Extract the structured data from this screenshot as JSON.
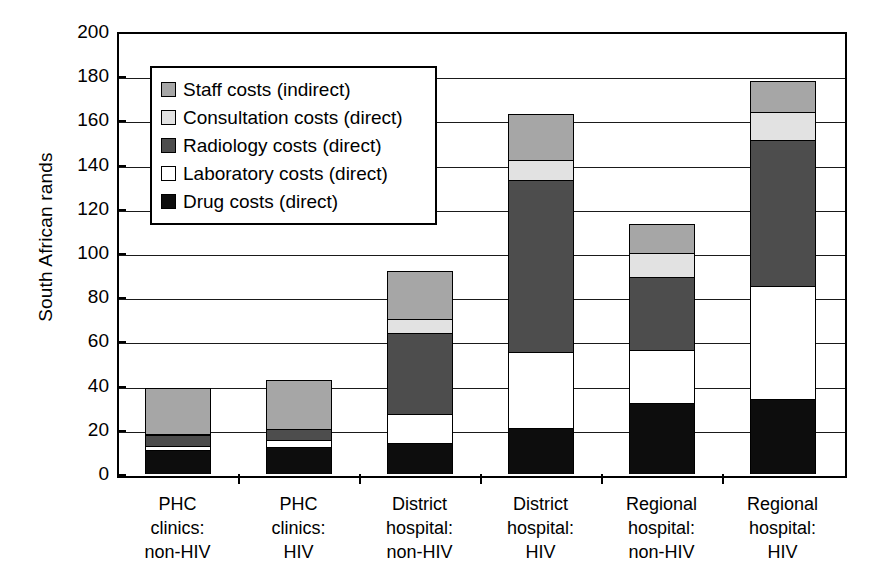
{
  "chart_data": {
    "type": "bar",
    "subtype": "stacked",
    "title": "",
    "xlabel": "",
    "ylabel": "South African rands",
    "ylim": [
      0,
      200
    ],
    "ytick_step": 20,
    "yticks": [
      200,
      180,
      160,
      140,
      120,
      100,
      80,
      60,
      40,
      20,
      0
    ],
    "grid": true,
    "legend_position": "upper-left-inside",
    "categories": [
      "PHC\nclinics:\nnon-HIV",
      "PHC\nclinics:\nHIV",
      "District\nhospital:\nnon-HIV",
      "District\nhospital:\nHIV",
      "Regional\nhospital:\nnon-HIV",
      "Regional\nhospital:\nHIV"
    ],
    "category_lines": [
      [
        "PHC",
        "clinics:",
        "non-HIV"
      ],
      [
        "PHC",
        "clinics:",
        "HIV"
      ],
      [
        "District",
        "hospital:",
        "non-HIV"
      ],
      [
        "District",
        "hospital:",
        "HIV"
      ],
      [
        "Regional",
        "hospital:",
        "non-HIV"
      ],
      [
        "Regional",
        "hospital:",
        "HIV"
      ]
    ],
    "series": [
      {
        "name": "Drug costs (direct)",
        "color": "#0d0d0d",
        "values": [
          11,
          12,
          14,
          21,
          32,
          34
        ]
      },
      {
        "name": "Laboratory costs (direct)",
        "color": "#ffffff",
        "values": [
          1.5,
          3.5,
          13,
          34,
          24,
          51
        ]
      },
      {
        "name": "Radiology costs (direct)",
        "color": "#4d4d4d",
        "values": [
          5,
          5,
          37,
          78,
          33,
          66
        ]
      },
      {
        "name": "Consultation costs (direct)",
        "color": "#e2e2e2",
        "values": [
          0.5,
          0,
          6,
          9,
          11,
          13
        ]
      },
      {
        "name": "Staff costs (indirect)",
        "color": "#a6a6a6",
        "values": [
          21,
          22,
          22,
          21,
          13,
          14
        ]
      }
    ],
    "totals": [
      39,
      42,
      92,
      163,
      113,
      178
    ]
  },
  "legend": {
    "items": [
      {
        "label": "Staff costs (indirect)",
        "color": "#a6a6a6"
      },
      {
        "label": "Consultation costs (direct)",
        "color": "#e2e2e2"
      },
      {
        "label": "Radiology costs (direct)",
        "color": "#4d4d4d"
      },
      {
        "label": "Laboratory costs (direct)",
        "color": "#ffffff"
      },
      {
        "label": "Drug costs (direct)",
        "color": "#0d0d0d"
      }
    ]
  },
  "axes": {
    "y_title": "South African rands",
    "y_tick_labels": [
      "200",
      "180",
      "160",
      "140",
      "120",
      "100",
      "80",
      "60",
      "40",
      "20",
      "0"
    ]
  },
  "colors": {
    "axis": "#000000",
    "grid": "#1a1a1a",
    "background": "#ffffff"
  }
}
